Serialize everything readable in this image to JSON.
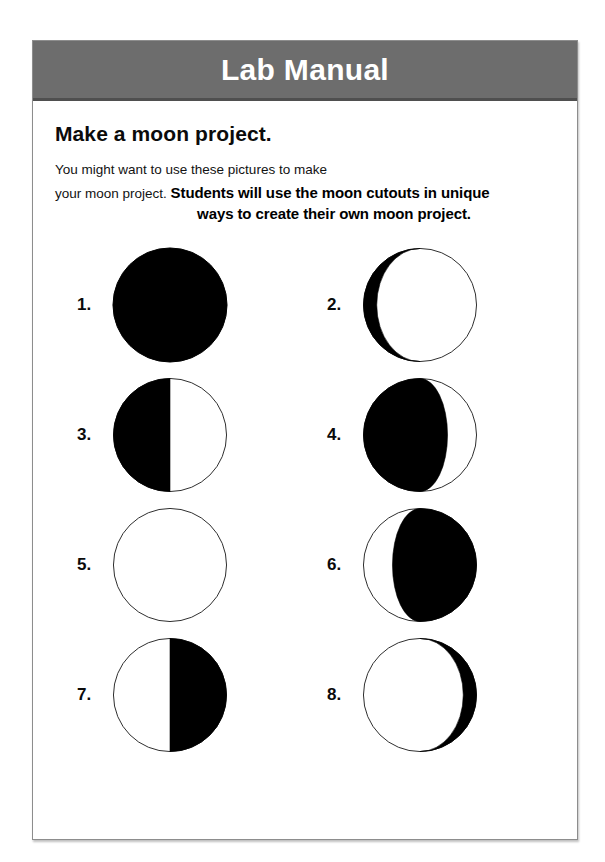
{
  "header": {
    "title": "Lab Manual",
    "band_color": "#6d6d6d",
    "title_color": "#ffffff"
  },
  "content": {
    "section_title": "Make a moon project.",
    "intro_line_1": "You might want to use these pictures to make",
    "intro_line_2": "your moon project.",
    "answer_line_1": "Students will use the moon cutouts in unique",
    "answer_line_2": "ways to create their own moon project."
  },
  "moons": [
    {
      "label": "1.",
      "phase": "new-moon",
      "name": "moon-phase-new"
    },
    {
      "label": "2.",
      "phase": "waning-crescent-thin-light-right",
      "name": "moon-phase-waning-crescent"
    },
    {
      "label": "3.",
      "phase": "half-dark-left",
      "name": "moon-phase-last-quarter"
    },
    {
      "label": "4.",
      "phase": "crescent-dark-left",
      "name": "moon-phase-waxing-gibbous"
    },
    {
      "label": "5.",
      "phase": "full-moon",
      "name": "moon-phase-full"
    },
    {
      "label": "6.",
      "phase": "crescent-dark-right",
      "name": "moon-phase-waning-gibbous"
    },
    {
      "label": "7.",
      "phase": "half-dark-right",
      "name": "moon-phase-first-quarter"
    },
    {
      "label": "8.",
      "phase": "waxing-crescent-thin-light-left",
      "name": "moon-phase-waxing-crescent"
    }
  ],
  "colors": {
    "dark_side": "#000000",
    "light_side": "#ffffff",
    "outline": "#2b2b2b",
    "page_border": "#8d8d8d"
  }
}
